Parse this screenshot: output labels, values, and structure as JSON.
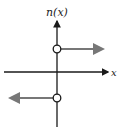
{
  "diagram": {
    "function_label": "n(x)",
    "x_axis_label": "x",
    "colors": {
      "axes": "#1a1a1a",
      "function": "#777777",
      "circle_fill": "#ffffff"
    },
    "pieces": [
      {
        "domain": "x > 0",
        "value": "positive constant",
        "endpoint": "open circle at x = 0",
        "direction": "right"
      },
      {
        "domain": "x < 0",
        "value": "negative constant",
        "endpoint": "open circle at x = 0",
        "direction": "left"
      }
    ]
  }
}
